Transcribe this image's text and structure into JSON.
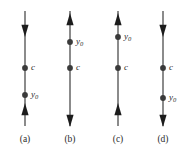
{
  "figure": {
    "width": 187,
    "height": 152,
    "background_color": "#ffffff",
    "line_color": "#6e6e6e",
    "dot_color": "#3a3a3a",
    "text_color": "#2b2b2b",
    "axis_top_y": 11,
    "axis_bottom_y": 126,
    "caption_y": 135
  },
  "panels": [
    {
      "id": "a",
      "caption": "(a)",
      "axis_x": 25,
      "top_arrow_direction": "down",
      "bottom_arrow_direction": "up",
      "top_arrow_y": 28,
      "bottom_arrow_y": 112,
      "points": [
        {
          "label": "c",
          "sub": "",
          "y": 68,
          "label_x_offset": 6
        },
        {
          "label": "y",
          "sub": "0",
          "y": 95,
          "label_x_offset": 6
        }
      ]
    },
    {
      "id": "b",
      "caption": "(b)",
      "axis_x": 70,
      "top_arrow_direction": "up",
      "bottom_arrow_direction": "down",
      "top_arrow_y": 22,
      "bottom_arrow_y": 118,
      "points": [
        {
          "label": "y",
          "sub": "0",
          "y": 42,
          "label_x_offset": 6
        },
        {
          "label": "c",
          "sub": "",
          "y": 68,
          "label_x_offset": 6
        }
      ]
    },
    {
      "id": "c",
      "caption": "(c)",
      "axis_x": 118,
      "top_arrow_direction": "up",
      "bottom_arrow_direction": "up",
      "top_arrow_y": 22,
      "bottom_arrow_y": 112,
      "points": [
        {
          "label": "y",
          "sub": "0",
          "y": 37,
          "label_x_offset": 6
        },
        {
          "label": "c",
          "sub": "",
          "y": 68,
          "label_x_offset": 6
        }
      ]
    },
    {
      "id": "d",
      "caption": "(d)",
      "axis_x": 163,
      "top_arrow_direction": "down",
      "bottom_arrow_direction": "down",
      "top_arrow_y": 28,
      "bottom_arrow_y": 118,
      "points": [
        {
          "label": "c",
          "sub": "",
          "y": 68,
          "label_x_offset": 6
        },
        {
          "label": "y",
          "sub": "0",
          "y": 98,
          "label_x_offset": 6
        }
      ]
    }
  ]
}
